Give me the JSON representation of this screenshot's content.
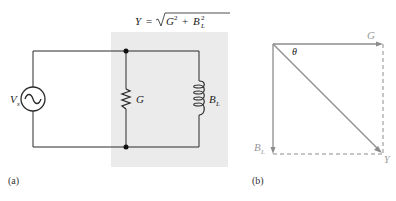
{
  "figure_a": {
    "caption": "(a)",
    "formula": {
      "lhs": "Y",
      "eq": "=",
      "radicand_g": "G",
      "exp": "2",
      "plus": "+",
      "radicand_b": "B",
      "sub": "L"
    },
    "source_label": "V",
    "source_sub": "s",
    "resistor_label": "G",
    "inductor_label": "B",
    "inductor_sub": "L",
    "shade_color": "#ebebeb",
    "wire_color": "#2a2a2a"
  },
  "figure_b": {
    "caption": "(b)",
    "g_label": "G",
    "bl_label": "B",
    "bl_sub": "L",
    "y_label": "Y",
    "angle_label": "θ",
    "phasor_color": "#8c8c8c"
  }
}
